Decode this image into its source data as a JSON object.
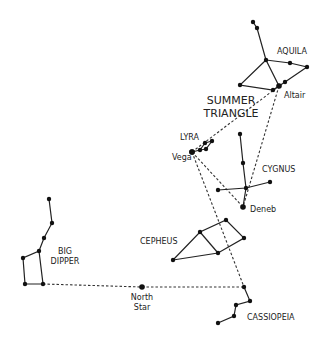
{
  "diagram": {
    "title": "SUMMER TRIANGLE",
    "title_lines": [
      "SUMMER",
      "TRIANGLE"
    ],
    "constellations": [
      {
        "name": "AQUILA",
        "label_pos": [
          277,
          54
        ],
        "stars": [
          [
            253,
            22
          ],
          [
            257,
            28
          ],
          [
            266,
            60
          ],
          [
            290,
            63
          ],
          [
            307,
            67
          ],
          [
            240,
            85
          ],
          [
            279,
            86
          ],
          [
            273,
            90
          ],
          [
            285,
            82
          ]
        ],
        "lines": [
          [
            [
              253,
              22
            ],
            [
              257,
              28
            ],
            [
              266,
              60
            ]
          ],
          [
            [
              266,
              60
            ],
            [
              290,
              63
            ],
            [
              307,
              67
            ],
            [
              285,
              82
            ],
            [
              279,
              86
            ]
          ],
          [
            [
              266,
              60
            ],
            [
              240,
              85
            ],
            [
              273,
              90
            ],
            [
              279,
              86
            ]
          ],
          [
            [
              266,
              60
            ],
            [
              279,
              86
            ]
          ]
        ]
      },
      {
        "name": "LYRA",
        "label_pos": [
          193,
          139
        ],
        "stars": [
          [
            192,
            152
          ],
          [
            200,
            150
          ],
          [
            206,
            149
          ],
          [
            205,
            143
          ],
          [
            212,
            141
          ]
        ],
        "lines": [
          [
            [
              192,
              152
            ],
            [
              200,
              150
            ],
            [
              206,
              149
            ],
            [
              212,
              141
            ],
            [
              205,
              143
            ],
            [
              200,
              150
            ]
          ]
        ]
      },
      {
        "name": "CYGNUS",
        "label_pos": [
          262,
          172
        ],
        "stars": [
          [
            240,
            134
          ],
          [
            243,
            163
          ],
          [
            246,
            188
          ],
          [
            270,
            182
          ],
          [
            218,
            190
          ],
          [
            243,
            207
          ]
        ],
        "lines": [
          [
            [
              240,
              134
            ],
            [
              243,
              163
            ],
            [
              246,
              188
            ],
            [
              243,
              207
            ]
          ],
          [
            [
              218,
              190
            ],
            [
              246,
              188
            ],
            [
              270,
              182
            ]
          ]
        ]
      },
      {
        "name": "CEPHEUS",
        "label_pos": [
          160,
          244
        ],
        "stars": [
          [
            173,
            260
          ],
          [
            200,
            232
          ],
          [
            226,
            220
          ],
          [
            244,
            238
          ],
          [
            218,
            253
          ]
        ],
        "lines": [
          [
            [
              173,
              260
            ],
            [
              200,
              232
            ],
            [
              226,
              220
            ],
            [
              244,
              238
            ],
            [
              218,
              253
            ],
            [
              173,
              260
            ]
          ],
          [
            [
              200,
              232
            ],
            [
              218,
              253
            ]
          ]
        ]
      },
      {
        "name": "BIG DIPPER",
        "label_lines": [
          "BIG",
          "DIPPER"
        ],
        "label_pos": [
          56,
          252
        ],
        "stars": [
          [
            49,
            199
          ],
          [
            52,
            223
          ],
          [
            44,
            238
          ],
          [
            39,
            251
          ],
          [
            23,
            258
          ],
          [
            25,
            284
          ],
          [
            43,
            284
          ]
        ],
        "lines": [
          [
            [
              49,
              199
            ],
            [
              52,
              223
            ],
            [
              44,
              238
            ],
            [
              39,
              251
            ],
            [
              23,
              258
            ],
            [
              25,
              284
            ],
            [
              43,
              284
            ],
            [
              39,
              251
            ]
          ]
        ]
      },
      {
        "name": "CASSIOPEIA",
        "label_pos": [
          247,
          320
        ],
        "stars": [
          [
            244,
            287
          ],
          [
            250,
            301
          ],
          [
            236,
            305
          ],
          [
            234,
            316
          ],
          [
            218,
            323
          ]
        ],
        "lines": [
          [
            [
              244,
              287
            ],
            [
              250,
              301
            ],
            [
              236,
              305
            ],
            [
              234,
              316
            ],
            [
              218,
              323
            ]
          ]
        ]
      }
    ],
    "named_stars": [
      {
        "name": "Altair",
        "pos": [
          279,
          86
        ],
        "label_pos": [
          284,
          97
        ]
      },
      {
        "name": "Vega",
        "pos": [
          192,
          152
        ],
        "label_pos": [
          172,
          159
        ]
      },
      {
        "name": "Deneb",
        "pos": [
          243,
          207
        ],
        "label_pos": [
          250,
          211
        ]
      },
      {
        "name": "North Star",
        "label_lines": [
          "North",
          "Star"
        ],
        "pos": [
          142,
          287
        ],
        "label_pos": [
          142,
          300
        ]
      }
    ],
    "dashed_guides": [
      [
        [
          192,
          152
        ],
        [
          279,
          86
        ]
      ],
      [
        [
          279,
          86
        ],
        [
          243,
          207
        ]
      ],
      [
        [
          192,
          152
        ],
        [
          243,
          207
        ]
      ],
      [
        [
          192,
          152
        ],
        [
          244,
          287
        ]
      ],
      [
        [
          43,
          284
        ],
        [
          142,
          287
        ],
        [
          244,
          287
        ]
      ]
    ],
    "colors": {
      "background": "#ffffff",
      "ink": "#111111"
    }
  }
}
